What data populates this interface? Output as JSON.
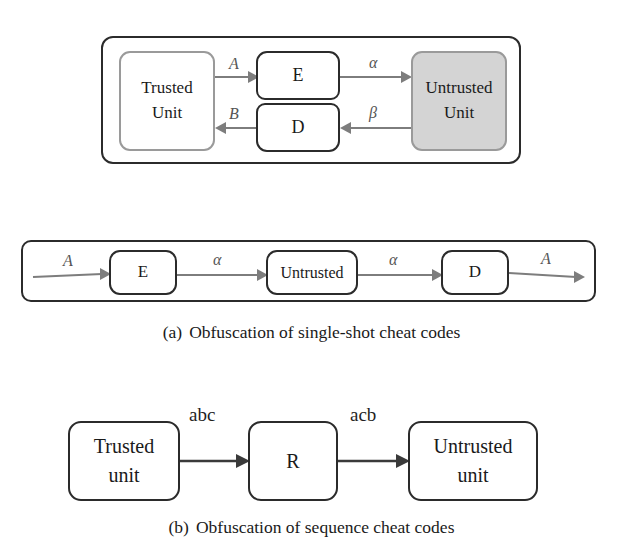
{
  "figure": {
    "subfigures": [
      {
        "tag": "(a)",
        "caption": "Obfuscation of single-shot cheat codes",
        "panels": [
          {
            "name": "two-way-obfuscation-panel",
            "nodes": [
              {
                "id": "trusted-unit",
                "lines": [
                  "Trusted",
                  "Unit"
                ],
                "fill": "#ffffff",
                "border": "#9a9a9a"
              },
              {
                "id": "encrypt",
                "lines": [
                  "E"
                ],
                "fill": "#ffffff",
                "border": "#2b2b2b"
              },
              {
                "id": "decrypt",
                "lines": [
                  "D"
                ],
                "fill": "#ffffff",
                "border": "#2b2b2b"
              },
              {
                "id": "untrusted-unit",
                "lines": [
                  "Untrusted",
                  "Unit"
                ],
                "fill": "#d4d4d4",
                "border": "#9a9a9a"
              }
            ],
            "edges": [
              {
                "id": "trusted-to-encrypt",
                "label": "A",
                "from": "trusted-unit",
                "to": "encrypt",
                "direction": "right"
              },
              {
                "id": "encrypt-to-untrusted",
                "label": "α",
                "from": "encrypt",
                "to": "untrusted-unit",
                "direction": "right"
              },
              {
                "id": "untrusted-to-decrypt",
                "label": "β",
                "from": "untrusted-unit",
                "to": "decrypt",
                "direction": "left"
              },
              {
                "id": "decrypt-to-trusted",
                "label": "B",
                "from": "decrypt",
                "to": "trusted-unit",
                "direction": "left"
              }
            ]
          },
          {
            "name": "single-shot-chain-panel",
            "nodes": [
              {
                "id": "chain-e",
                "lines": [
                  "E"
                ],
                "fill": "#ffffff",
                "border": "#2b2b2b"
              },
              {
                "id": "chain-untrusted",
                "lines": [
                  "Untrusted"
                ],
                "fill": "#ffffff",
                "border": "#2b2b2b"
              },
              {
                "id": "chain-d",
                "lines": [
                  "D"
                ],
                "fill": "#ffffff",
                "border": "#2b2b2b"
              }
            ],
            "edges": [
              {
                "id": "chain-in",
                "label": "A",
                "from": "input",
                "to": "chain-e",
                "direction": "right"
              },
              {
                "id": "chain-e-to-untrusted",
                "label": "α",
                "from": "chain-e",
                "to": "chain-untrusted",
                "direction": "right"
              },
              {
                "id": "chain-untrusted-to-d",
                "label": "α",
                "from": "chain-untrusted",
                "to": "chain-d",
                "direction": "right"
              },
              {
                "id": "chain-out",
                "label": "A",
                "from": "chain-d",
                "to": "output",
                "direction": "right"
              }
            ]
          }
        ]
      },
      {
        "tag": "(b)",
        "caption": "Obfuscation of sequence cheat codes",
        "panels": [
          {
            "name": "sequence-obfuscation-panel",
            "nodes": [
              {
                "id": "b-trusted",
                "lines": [
                  "Trusted",
                  "unit"
                ],
                "fill": "#ffffff",
                "border": "#3a3a3a"
              },
              {
                "id": "b-r",
                "lines": [
                  "R"
                ],
                "fill": "#ffffff",
                "border": "#3a3a3a"
              },
              {
                "id": "b-untrusted",
                "lines": [
                  "Untrusted",
                  "unit"
                ],
                "fill": "#ffffff",
                "border": "#3a3a3a"
              }
            ],
            "edges": [
              {
                "id": "b-trusted-to-r",
                "label": "abc",
                "from": "b-trusted",
                "to": "b-r",
                "direction": "right"
              },
              {
                "id": "b-r-to-untrusted",
                "label": "acb",
                "from": "b-r",
                "to": "b-untrusted",
                "direction": "right"
              }
            ]
          }
        ]
      }
    ]
  },
  "colors": {
    "frame": "#2b2b2b",
    "arrow_gray": "#7d7d7d",
    "arrow_dark": "#3a3a3a",
    "shaded_fill": "#d4d4d4",
    "text": "#1a1a1a"
  }
}
